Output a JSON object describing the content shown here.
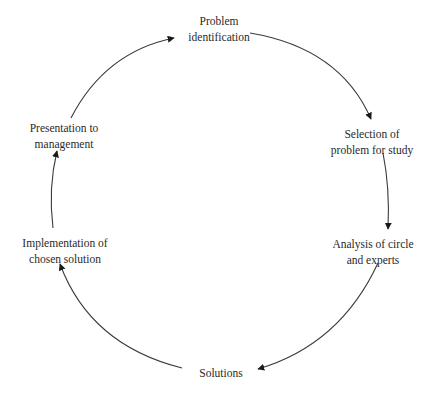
{
  "diagram": {
    "type": "cycle",
    "direction": "clockwise",
    "colors": {
      "line": "#3a3a3a",
      "arrow": "#1a1a1a",
      "text": "#2a2a2a",
      "background": "#ffffff"
    },
    "nodes": [
      {
        "id": "problem-identification",
        "lines": [
          "Problem",
          "identification"
        ]
      },
      {
        "id": "selection-of-problem",
        "lines": [
          "Selection of",
          "problem for study"
        ]
      },
      {
        "id": "analysis",
        "lines": [
          "Analysis of circle",
          "and experts"
        ]
      },
      {
        "id": "solutions",
        "lines": [
          "Solutions"
        ]
      },
      {
        "id": "implementation",
        "lines": [
          "Implementation of",
          "chosen solution"
        ]
      },
      {
        "id": "presentation",
        "lines": [
          "Presentation to",
          "management"
        ]
      }
    ],
    "edges": [
      {
        "from": "problem-identification",
        "to": "selection-of-problem"
      },
      {
        "from": "selection-of-problem",
        "to": "analysis"
      },
      {
        "from": "analysis",
        "to": "solutions"
      },
      {
        "from": "solutions",
        "to": "implementation"
      },
      {
        "from": "implementation",
        "to": "presentation"
      },
      {
        "from": "presentation",
        "to": "problem-identification"
      }
    ]
  }
}
